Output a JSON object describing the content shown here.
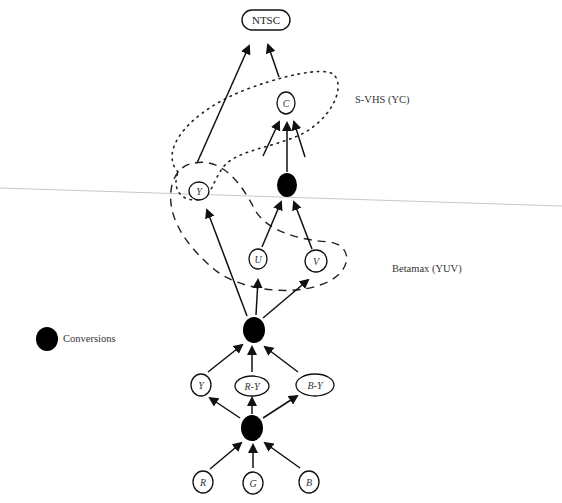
{
  "diagram": {
    "nodes": {
      "ntsc": "NTSC",
      "c": "C",
      "y_yc": "Y",
      "u": "U",
      "v": "V",
      "y": "Y",
      "r_minus_y": "R-Y",
      "b_minus_y": "B-Y",
      "r": "R",
      "g": "G",
      "b": "B"
    },
    "groups": {
      "svhs": "S-VHS (YC)",
      "betamax": "Betamax (YUV)"
    },
    "legend": {
      "conversions": "Conversions"
    },
    "edges": [
      [
        "R",
        "conversion-bottom"
      ],
      [
        "G",
        "conversion-bottom"
      ],
      [
        "B",
        "conversion-bottom"
      ],
      [
        "conversion-bottom",
        "Y"
      ],
      [
        "conversion-bottom",
        "R-Y"
      ],
      [
        "conversion-bottom",
        "B-Y"
      ],
      [
        "Y",
        "conversion-middle"
      ],
      [
        "R-Y",
        "conversion-middle"
      ],
      [
        "B-Y",
        "conversion-middle"
      ],
      [
        "conversion-middle",
        "Y (YC)"
      ],
      [
        "conversion-middle",
        "U"
      ],
      [
        "conversion-middle",
        "V"
      ],
      [
        "U",
        "conversion-top"
      ],
      [
        "V",
        "conversion-top"
      ],
      [
        "conversion-top",
        "C"
      ],
      [
        "Y (YC)",
        "NTSC"
      ],
      [
        "C",
        "NTSC"
      ]
    ]
  }
}
